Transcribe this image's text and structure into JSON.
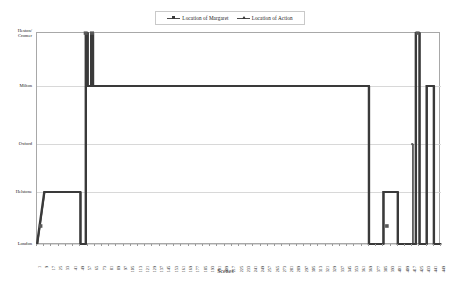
{
  "chart_data": {
    "type": "line",
    "title": "",
    "xlabel": "Scenes",
    "ylabel": "",
    "grid": true,
    "legend_position": "top-center",
    "y_categories": [
      "London",
      "Helstone",
      "Oxford",
      "Milton",
      "Heston/ Cromer"
    ],
    "y_category_labels": [
      {
        "line1": "Heston/",
        "line2": "Cromer"
      },
      {
        "line1": "Milton",
        "line2": ""
      },
      {
        "line1": "Oxford",
        "line2": ""
      },
      {
        "line1": "Helstone",
        "line2": ""
      },
      {
        "line1": "London",
        "line2": ""
      }
    ],
    "xlim": [
      1,
      449
    ],
    "x_tick_labels": [
      "1",
      "9",
      "17",
      "25",
      "33",
      "41",
      "49",
      "57",
      "65",
      "73",
      "81",
      "89",
      "97",
      "105",
      "113",
      "121",
      "129",
      "137",
      "145",
      "153",
      "161",
      "169",
      "177",
      "185",
      "193",
      "201",
      "209",
      "217",
      "225",
      "233",
      "241",
      "249",
      "257",
      "265",
      "273",
      "281",
      "289",
      "297",
      "305",
      "313",
      "321",
      "329",
      "337",
      "345",
      "353",
      "361",
      "369",
      "377",
      "385",
      "393",
      "401",
      "409",
      "417",
      "425",
      "433",
      "441",
      "449"
    ],
    "series": [
      {
        "name": "Location of Margaret",
        "marker": "square",
        "color": "#3a3a3a",
        "points": [
          {
            "x": 1,
            "y": "London"
          },
          {
            "x": 9,
            "y": "Helstone"
          },
          {
            "x": 49,
            "y": "Helstone"
          },
          {
            "x": 49,
            "y": "London"
          },
          {
            "x": 55,
            "y": "London"
          },
          {
            "x": 55,
            "y": "Heston/ Cromer"
          },
          {
            "x": 57,
            "y": "Heston/ Cromer"
          },
          {
            "x": 57,
            "y": "Milton"
          },
          {
            "x": 61,
            "y": "Milton"
          },
          {
            "x": 61,
            "y": "Heston/ Cromer"
          },
          {
            "x": 63,
            "y": "Heston/ Cromer"
          },
          {
            "x": 63,
            "y": "Milton"
          },
          {
            "x": 369,
            "y": "Milton"
          },
          {
            "x": 369,
            "y": "London"
          },
          {
            "x": 385,
            "y": "London"
          },
          {
            "x": 385,
            "y": "Helstone"
          },
          {
            "x": 401,
            "y": "Helstone"
          },
          {
            "x": 401,
            "y": "London"
          },
          {
            "x": 421,
            "y": "London"
          },
          {
            "x": 421,
            "y": "Heston/ Cromer"
          },
          {
            "x": 425,
            "y": "Heston/ Cromer"
          },
          {
            "x": 425,
            "y": "London"
          },
          {
            "x": 433,
            "y": "London"
          },
          {
            "x": 433,
            "y": "Milton"
          },
          {
            "x": 441,
            "y": "Milton"
          },
          {
            "x": 441,
            "y": "London"
          },
          {
            "x": 449,
            "y": "London"
          }
        ],
        "isolated_markers": [
          {
            "x": 5,
            "y_between": "Helstone-London"
          },
          {
            "x": 389,
            "y_between": "Helstone-London"
          }
        ]
      },
      {
        "name": "Location of Action",
        "marker": "triangle",
        "color": "#3a3a3a",
        "points": [
          {
            "x": 1,
            "y": "London"
          },
          {
            "x": 9,
            "y": "Helstone"
          },
          {
            "x": 49,
            "y": "Helstone"
          },
          {
            "x": 49,
            "y": "London"
          },
          {
            "x": 55,
            "y": "London"
          },
          {
            "x": 55,
            "y": "Heston/ Cromer"
          },
          {
            "x": 57,
            "y": "Heston/ Cromer"
          },
          {
            "x": 57,
            "y": "Milton"
          },
          {
            "x": 61,
            "y": "Milton"
          },
          {
            "x": 61,
            "y": "Heston/ Cromer"
          },
          {
            "x": 63,
            "y": "Heston/ Cromer"
          },
          {
            "x": 63,
            "y": "Milton"
          },
          {
            "x": 369,
            "y": "Milton"
          },
          {
            "x": 369,
            "y": "London"
          },
          {
            "x": 385,
            "y": "London"
          },
          {
            "x": 385,
            "y": "Helstone"
          },
          {
            "x": 401,
            "y": "Helstone"
          },
          {
            "x": 401,
            "y": "London"
          },
          {
            "x": 417,
            "y": "London"
          },
          {
            "x": 417,
            "y": "Oxford"
          },
          {
            "x": 417,
            "y": "London"
          },
          {
            "x": 421,
            "y": "London"
          },
          {
            "x": 421,
            "y": "Heston/ Cromer"
          },
          {
            "x": 425,
            "y": "Heston/ Cromer"
          },
          {
            "x": 425,
            "y": "London"
          },
          {
            "x": 433,
            "y": "London"
          },
          {
            "x": 433,
            "y": "Milton"
          },
          {
            "x": 441,
            "y": "Milton"
          },
          {
            "x": 441,
            "y": "London"
          },
          {
            "x": 449,
            "y": "London"
          }
        ]
      }
    ]
  },
  "legend": {
    "entries": [
      {
        "label": "Location of Margaret",
        "marker": "square"
      },
      {
        "label": "Location of Action",
        "marker": "triangle"
      }
    ]
  },
  "axis": {
    "x_title": "Scenes"
  }
}
